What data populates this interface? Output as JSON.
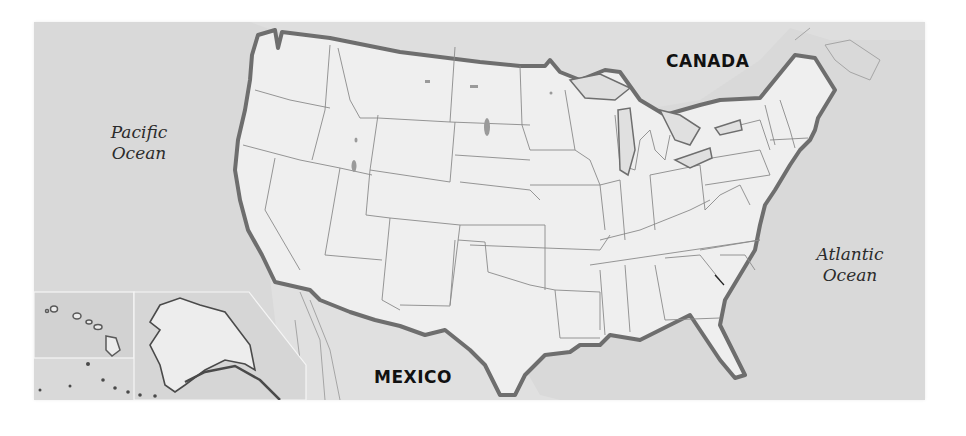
{
  "map": {
    "title": "United States map",
    "colors": {
      "water": "#d9d9d9",
      "land_us": "#eeeeee",
      "land_foreign": "#e2e2e2",
      "national_border": "#6e6e6e",
      "state_border": "#8a8a8a",
      "inset_border": "#f5f5f5"
    },
    "labels": {
      "pacific": [
        "Pacific",
        "Ocean"
      ],
      "atlantic": [
        "Atlantic",
        "Ocean"
      ],
      "canada": "CANADA",
      "mexico": "MEXICO"
    },
    "insets": [
      "Hawaii inset",
      "Alaska inset"
    ]
  }
}
